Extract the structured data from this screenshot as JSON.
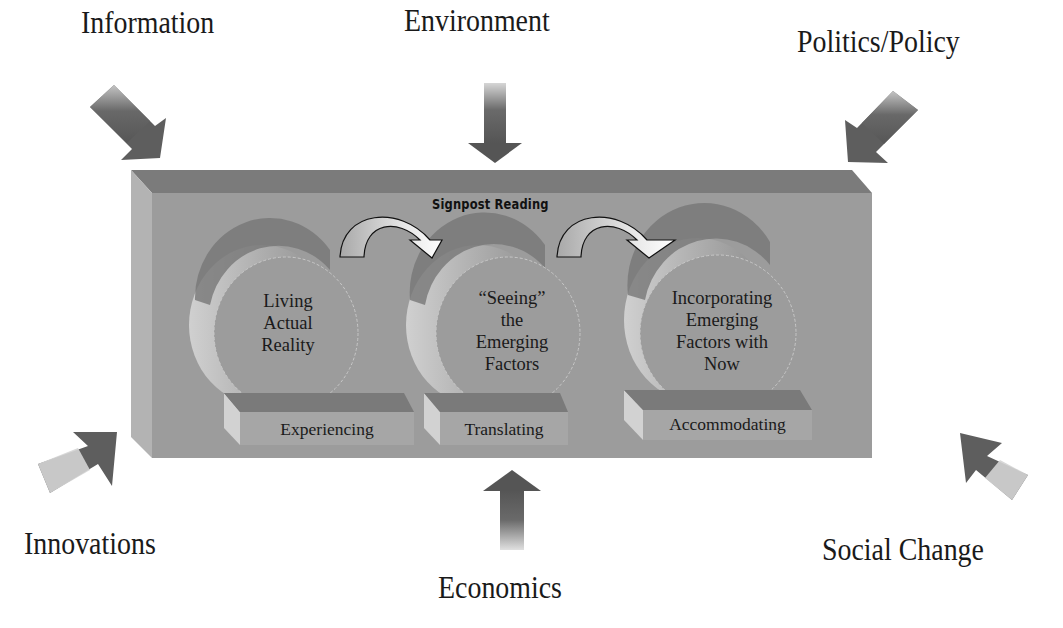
{
  "diagram": {
    "title": "Signpost Reading",
    "external_forces": [
      {
        "label": "Information",
        "position": "top-left",
        "arrow_direction": "down-right"
      },
      {
        "label": "Environment",
        "position": "top-center",
        "arrow_direction": "down"
      },
      {
        "label": "Politics/Policy",
        "position": "top-right",
        "arrow_direction": "down-left"
      },
      {
        "label": "Innovations",
        "position": "bottom-left",
        "arrow_direction": "up-right"
      },
      {
        "label": "Economics",
        "position": "bottom-center",
        "arrow_direction": "up"
      },
      {
        "label": "Social Change",
        "position": "bottom-right",
        "arrow_direction": "up-left"
      }
    ],
    "stages": [
      {
        "circle_lines": [
          "Living",
          "Actual",
          "Reality"
        ],
        "base_label": "Experiencing"
      },
      {
        "circle_lines": [
          "“Seeing”",
          "the",
          "Emerging",
          "Factors"
        ],
        "base_label": "Translating"
      },
      {
        "circle_lines": [
          "Incorporating",
          "Emerging",
          "Factors with",
          "Now"
        ],
        "base_label": "Accommodating"
      }
    ],
    "colors": {
      "panel_front": "#9a9a9a",
      "panel_top": "#7a7a7a",
      "panel_side": "#b0b0b0",
      "arrow_dark": "#5a5a5a",
      "arrow_light": "#d8d8d8"
    }
  }
}
